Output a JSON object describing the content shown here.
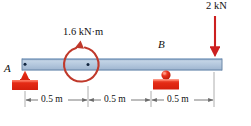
{
  "figure": {
    "type": "beam-free-body-diagram",
    "labels": {
      "support_a": "A",
      "support_b": "B",
      "moment": "1.6 kN·m",
      "force": "2 kN"
    },
    "dimensions": [
      {
        "label": "0.5 m",
        "from": "A",
        "to": "moment"
      },
      {
        "label": "0.5 m",
        "from": "moment",
        "to": "B"
      },
      {
        "label": "0.5 m",
        "from": "B",
        "to": "load"
      }
    ],
    "loads": [
      {
        "name": "applied-couple",
        "value": "1.6 kN·m",
        "sense": "counterclockwise",
        "position_m": 0.5
      },
      {
        "name": "point-load",
        "value": "2 kN",
        "direction": "down",
        "position_m": 1.5
      }
    ],
    "supports": [
      {
        "name": "pin-support",
        "label": "A",
        "position_m": 0.0,
        "kind": "pin"
      },
      {
        "name": "roller-support",
        "label": "B",
        "position_m": 1.0,
        "kind": "roller"
      }
    ],
    "colors": {
      "beam_fill": "#aec4dd",
      "beam_edge": "#5d7fa6",
      "support_red": "#e02a18",
      "load_red": "#cc2020",
      "moment_red": "#c0392b",
      "dimension_gray": "#6b6b6b",
      "text": "#111111"
    }
  }
}
